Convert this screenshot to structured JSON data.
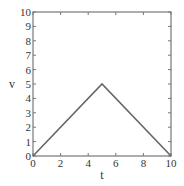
{
  "chart_data": {
    "type": "line",
    "title": "",
    "xlabel": "t",
    "ylabel": "v",
    "xlim": [
      0,
      10
    ],
    "ylim": [
      0,
      10
    ],
    "xticks": [
      0,
      2,
      4,
      6,
      8,
      10
    ],
    "yticks": [
      0,
      1,
      2,
      3,
      4,
      5,
      6,
      7,
      8,
      9,
      10
    ],
    "grid": false,
    "legend": null,
    "series": [
      {
        "name": "v(t)",
        "x": [
          0,
          5,
          10
        ],
        "y": [
          0,
          5,
          0
        ],
        "color": "#666666"
      }
    ]
  },
  "colors": {
    "axes": "#777777",
    "line": "#666666",
    "text": "#333333",
    "background": "#ffffff"
  }
}
